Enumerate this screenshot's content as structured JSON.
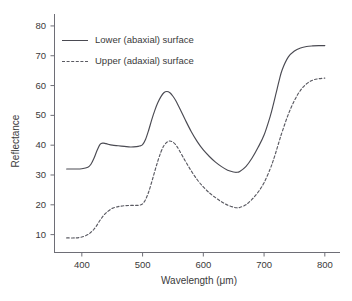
{
  "chart_data": {
    "type": "line",
    "title": "",
    "xlabel": "Wavelength (μm)",
    "ylabel": "Reflectance",
    "xlim": [
      355,
      825
    ],
    "ylim": [
      4,
      84
    ],
    "xticks": [
      400,
      500,
      600,
      700,
      800
    ],
    "yticks": [
      10,
      20,
      30,
      40,
      50,
      60,
      70,
      80
    ],
    "xtick_labels": [
      "400",
      "500",
      "600",
      "700",
      "800"
    ],
    "ytick_labels": [
      "10",
      "20",
      "30",
      "40",
      "50",
      "60",
      "70",
      "80"
    ],
    "grid": false,
    "legend_position": "upper-left-inside",
    "x": [
      375,
      390,
      400,
      410,
      415,
      420,
      425,
      430,
      435,
      440,
      450,
      460,
      470,
      480,
      490,
      495,
      500,
      505,
      510,
      515,
      520,
      525,
      530,
      535,
      540,
      545,
      550,
      555,
      560,
      570,
      580,
      590,
      600,
      610,
      620,
      630,
      640,
      650,
      655,
      660,
      670,
      680,
      690,
      700,
      710,
      715,
      720,
      725,
      730,
      740,
      750,
      760,
      770,
      780,
      790,
      800
    ],
    "series": [
      {
        "name": "Lower (abaxial) surface",
        "style": "solid",
        "color": "#4a4a52",
        "values": [
          32.0,
          32.0,
          32.1,
          32.6,
          33.6,
          35.6,
          38.2,
          40.3,
          40.7,
          40.5,
          40.0,
          39.8,
          39.6,
          39.4,
          39.5,
          39.7,
          40.2,
          42.0,
          45.0,
          48.5,
          51.6,
          54.2,
          56.2,
          57.6,
          58.0,
          57.6,
          56.4,
          54.8,
          52.8,
          48.6,
          44.6,
          41.2,
          38.4,
          36.2,
          34.3,
          32.8,
          31.6,
          31.0,
          30.9,
          31.2,
          32.8,
          35.6,
          39.2,
          43.4,
          49.6,
          53.4,
          57.6,
          61.8,
          65.4,
          69.6,
          71.6,
          72.6,
          73.1,
          73.3,
          73.4,
          73.4
        ]
      },
      {
        "name": "Upper (adaxial) surface",
        "style": "dashed",
        "color": "#5a5a62",
        "values": [
          8.9,
          8.9,
          9.2,
          10.0,
          10.8,
          11.8,
          13.2,
          14.8,
          16.2,
          17.3,
          18.8,
          19.4,
          19.7,
          19.8,
          19.8,
          19.9,
          20.3,
          21.8,
          24.3,
          27.6,
          31.2,
          34.6,
          37.6,
          39.8,
          41.0,
          41.4,
          41.0,
          40.0,
          38.4,
          34.8,
          31.4,
          28.4,
          26.0,
          24.0,
          22.4,
          21.0,
          19.9,
          19.2,
          19.0,
          19.1,
          20.0,
          21.8,
          24.2,
          27.4,
          32.0,
          34.8,
          38.0,
          41.4,
          44.6,
          50.4,
          55.0,
          58.4,
          60.6,
          61.8,
          62.3,
          62.5
        ]
      }
    ]
  },
  "legend": {
    "items": [
      {
        "label": "Lower (abaxial) surface",
        "style": "solid"
      },
      {
        "label": "Upper (adaxial) surface",
        "style": "dashed"
      }
    ]
  },
  "axes": {
    "x_axis_label": "Wavelength (μm)",
    "y_axis_label": "Reflectance"
  }
}
